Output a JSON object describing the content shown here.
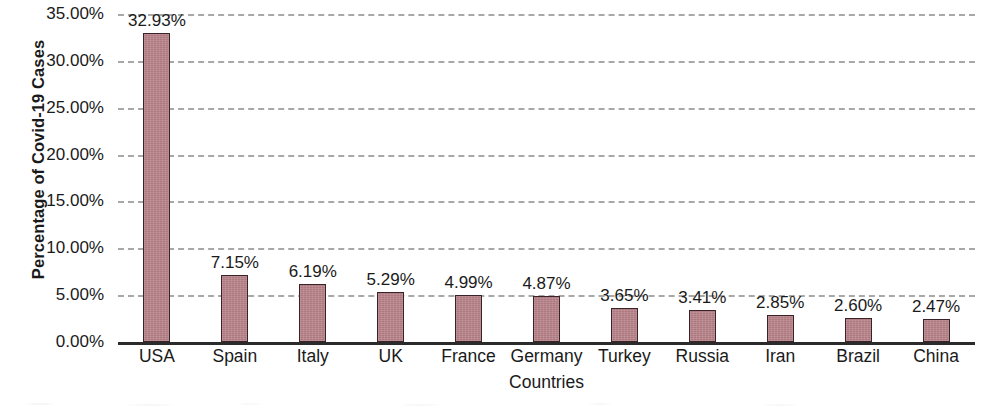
{
  "chart_data": {
    "type": "bar",
    "title": "",
    "xlabel": "Countries",
    "ylabel": "Percentage of Covid-19 Cases",
    "categories": [
      "USA",
      "Spain",
      "Italy",
      "UK",
      "France",
      "Germany",
      "Turkey",
      "Russia",
      "Iran",
      "Brazil",
      "China"
    ],
    "values": [
      32.93,
      7.15,
      6.19,
      5.29,
      4.99,
      4.87,
      3.65,
      3.41,
      2.85,
      2.6,
      2.47
    ],
    "value_labels": [
      "32.93%",
      "7.15%",
      "6.19%",
      "5.29%",
      "4.99%",
      "4.87%",
      "3.65%",
      "3.41%",
      "2.85%",
      "2.60%",
      "2.47%"
    ],
    "ylim": [
      0,
      35
    ],
    "y_ticks": [
      0,
      5,
      10,
      15,
      20,
      25,
      30,
      35
    ],
    "y_tick_labels": [
      "0.00%",
      "5.00%",
      "10.00%",
      "15.00%",
      "20.00%",
      "25.00%",
      "30.00%",
      "35.00%"
    ],
    "grid": true,
    "grid_style": "dashed",
    "grid_axis": "y",
    "legend": "none",
    "bar_color": "#bb858c",
    "bar_edge_color": "#3a2326",
    "gridline_color": "#9a9a9a",
    "axis_color": "#2b2b2b",
    "background_color": "#ffffff",
    "series": [
      {
        "name": "Percentage of Covid-19 Cases",
        "values": [
          32.93,
          7.15,
          6.19,
          5.29,
          4.99,
          4.87,
          3.65,
          3.41,
          2.85,
          2.6,
          2.47
        ]
      }
    ]
  }
}
